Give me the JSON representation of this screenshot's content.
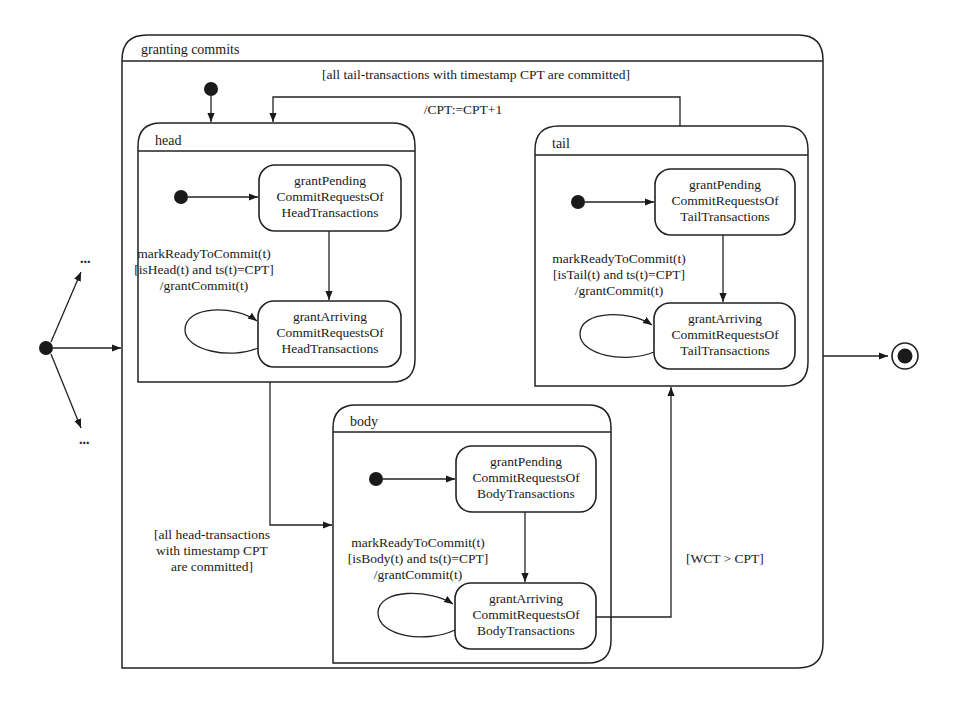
{
  "diagram": {
    "type": "UML state machine",
    "outer_state": {
      "name": "granting commits"
    },
    "regions": {
      "head": {
        "name": "head",
        "state_pending": [
          "grantPending",
          "CommitRequestsOf",
          "HeadTransactions"
        ],
        "state_arriving": [
          "grantArriving",
          "CommitRequestsOf",
          "HeadTransactions"
        ],
        "self_loop_label": [
          "markReadyToCommit(t)",
          "[isHead(t) and ts(t)=CPT]",
          "/grantCommit(t)"
        ]
      },
      "tail": {
        "name": "tail",
        "state_pending": [
          "grantPending",
          "CommitRequestsOf",
          "TailTransactions"
        ],
        "state_arriving": [
          "grantArriving",
          "CommitRequestsOf",
          "TailTransactions"
        ],
        "self_loop_label": [
          "markReadyToCommit(t)",
          "[isTail(t) and ts(t)=CPT]",
          "/grantCommit(t)"
        ]
      },
      "body": {
        "name": "body",
        "state_pending": [
          "grantPending",
          "CommitRequestsOf",
          "BodyTransactions"
        ],
        "state_arriving": [
          "grantArriving",
          "CommitRequestsOf",
          "BodyTransactions"
        ],
        "self_loop_label": [
          "markReadyToCommit(t)",
          "[isBody(t) and ts(t)=CPT]",
          "/grantCommit(t)"
        ]
      }
    },
    "transitions": {
      "tail_to_head_guard": "[all tail-transactions with timestamp CPT are committed]",
      "tail_to_head_action": "/CPT:=CPT+1",
      "head_to_body_guard": [
        "[all head-transactions",
        "with timestamp CPT",
        "are committed]"
      ],
      "body_to_tail_guard": "[WCT > CPT]"
    },
    "ellipsis_top": "...",
    "ellipsis_bottom": "..."
  }
}
